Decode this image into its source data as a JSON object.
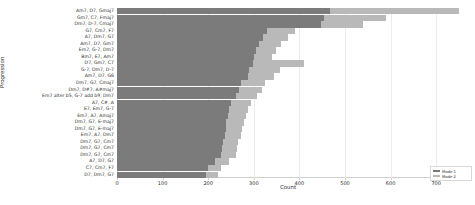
{
  "chart_data": {
    "type": "bar",
    "orientation": "horizontal",
    "stacked": true,
    "title": "",
    "xlabel": "Count",
    "ylabel": "Progression",
    "xlim": [
      0,
      750
    ],
    "xticks": [
      0,
      100,
      200,
      300,
      400,
      500,
      600,
      700
    ],
    "grid": true,
    "legend_position": "lower right",
    "categories": [
      "Am7, D7, Gmaj7",
      "Gm7, C7, Fmaj7",
      "Dm7, D-7, Cmaj7",
      "G7, Cm7, F7",
      "A7, Dm7, G7",
      "Am7, D7, Gm7",
      "Em7, G-7, Dm7",
      "Bm7, E7, Am7",
      "D7, Gm7, C7",
      "G-7, Dm7, D-7",
      "Am7, D7, G6",
      "Dm7, G7, Cmaj7",
      "Dm7, D#7, A#maj7",
      "Em7 alter b5, G-7 add b9, Dm7",
      "A7, C#, A",
      "E7, Em7, G-7",
      "Em7, A7, Amaj7",
      "Dm7, G7, E-maj7",
      "Dm7, G7, E-maj7",
      "Em7, A7, Dm7",
      "Dm7, G7, Cm7",
      "Dm7, G7, Cm7",
      "Dm7, G7, Cm7",
      "A7, D7, G7",
      "C7, Cm7, F7",
      "D7, Dm7, G7"
    ],
    "series": [
      {
        "name": "Mode 1",
        "color": "#7b7b7b",
        "values": [
          468,
          455,
          448,
          330,
          320,
          312,
          305,
          300,
          298,
          290,
          288,
          272,
          268,
          262,
          250,
          246,
          244,
          240,
          238,
          236,
          232,
          230,
          228,
          215,
          200,
          196
        ]
      },
      {
        "name": "Mode 2",
        "color": "#b9b9b9",
        "values": [
          282,
          135,
          92,
          60,
          55,
          48,
          44,
          40,
          112,
          68,
          56,
          52,
          50,
          46,
          44,
          42,
          40,
          38,
          37,
          36,
          34,
          33,
          32,
          30,
          28,
          26
        ]
      }
    ]
  },
  "legend": {
    "entries": [
      {
        "label": "Mode 1",
        "color": "#7b7b7b"
      },
      {
        "label": "Mode 2",
        "color": "#b9b9b9"
      }
    ]
  }
}
